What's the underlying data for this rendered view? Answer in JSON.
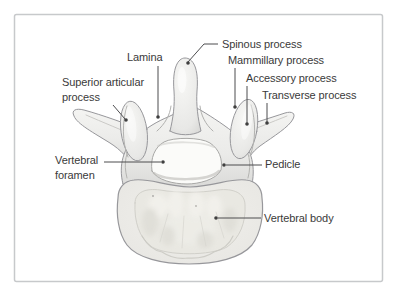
{
  "diagram": {
    "colors": {
      "background": "#ffffff",
      "frame_border": "#c7c9cb",
      "bone_outline": "#97979b",
      "label_text": "#3a3a3a",
      "leader_line": "#4d4d4f"
    },
    "labels": [
      {
        "name": "spinous-process",
        "text": "Spinous process"
      },
      {
        "name": "lamina",
        "text": "Lamina"
      },
      {
        "name": "mammillary-process",
        "text": "Mammillary process"
      },
      {
        "name": "superior-articular-process",
        "text": "Superior articular\nprocess"
      },
      {
        "name": "accessory-process",
        "text": "Accessory process"
      },
      {
        "name": "transverse-process",
        "text": "Transverse process"
      },
      {
        "name": "vertebral-foramen",
        "text": "Vertebral\nforamen"
      },
      {
        "name": "pedicle",
        "text": "Pedicle"
      },
      {
        "name": "vertebral-body",
        "text": "Vertebral body"
      }
    ]
  }
}
